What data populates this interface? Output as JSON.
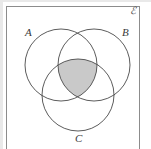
{
  "figure": {
    "name": "venn-diagram-three-sets",
    "universe_label": "ℰ",
    "labels": {
      "A": "A",
      "B": "B",
      "C": "C"
    },
    "shaded_region": "A∩B∩C",
    "colors": {
      "background": "#ffffff",
      "stroke": "#4a4a4a",
      "frame_stroke": "#8c8c8c",
      "shade_fill": "#c9c9c9"
    },
    "geometry": {
      "frame": {
        "x": 6,
        "y": 6,
        "width": 134,
        "height": 145
      },
      "circles": [
        {
          "id": "A",
          "cx": 61,
          "cy": 65,
          "r": 36
        },
        {
          "id": "B",
          "cx": 94,
          "cy": 65,
          "r": 36
        },
        {
          "id": "C",
          "cx": 78,
          "cy": 95,
          "r": 36
        }
      ]
    }
  }
}
